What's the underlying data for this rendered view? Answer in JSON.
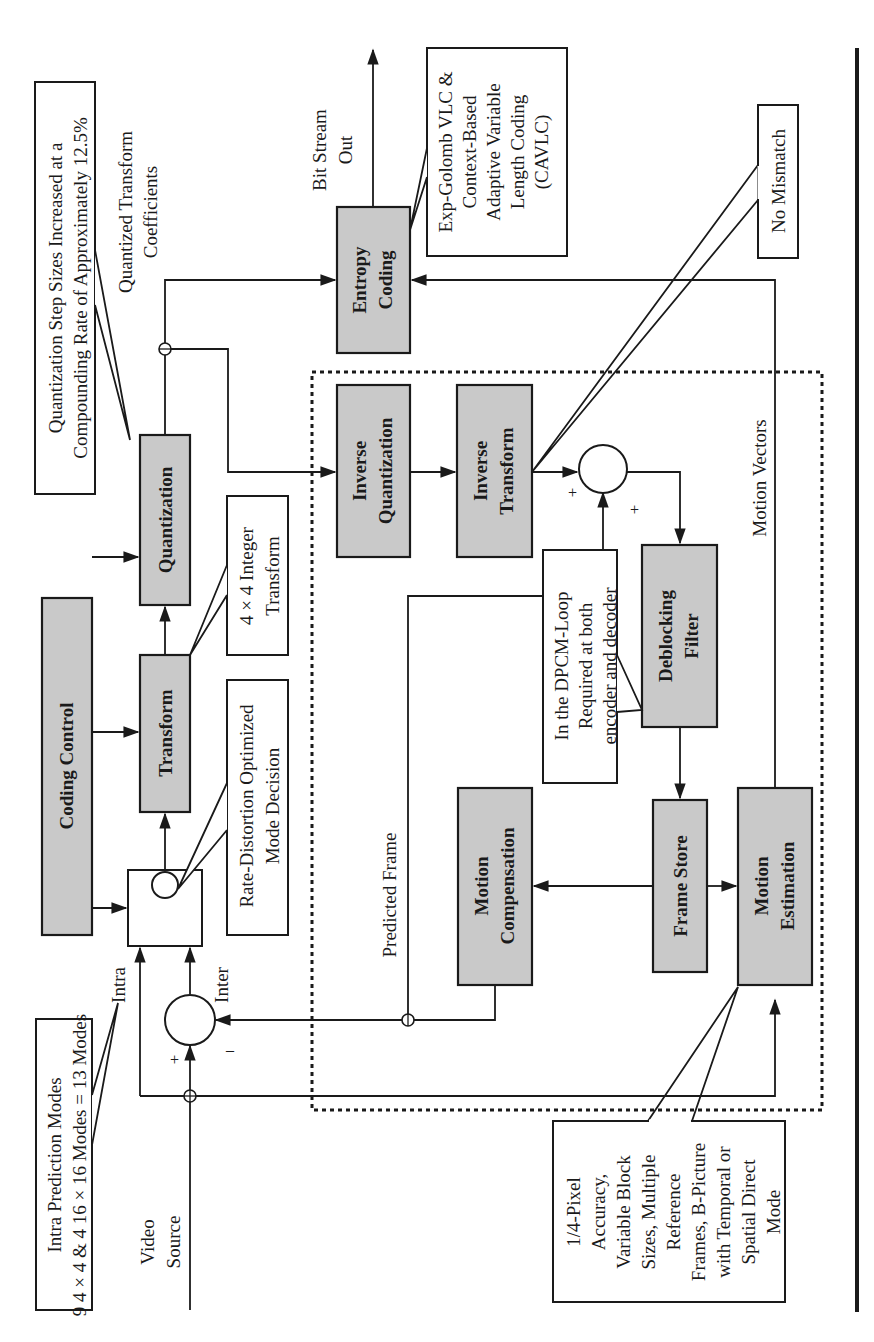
{
  "figure": {
    "orientation": "rotated-90-ccw",
    "colors": {
      "block_fill": "#c9c9c9",
      "stroke": "#1a1a1a",
      "background": "#ffffff"
    }
  },
  "inputs": {
    "video_source": [
      "Video",
      "Source"
    ]
  },
  "outputs": {
    "bit_stream": [
      "Bit Stream",
      "Out"
    ]
  },
  "blocks": {
    "coding_control": [
      "Coding Control"
    ],
    "transform": [
      "Transform"
    ],
    "quantization": [
      "Quantization"
    ],
    "entropy_coding": [
      "Entropy",
      "Coding"
    ],
    "inverse_quantization": [
      "Inverse",
      "Quantization"
    ],
    "inverse_transform": [
      "Inverse",
      "Transform"
    ],
    "deblocking_filter": [
      "Deblocking",
      "Filter"
    ],
    "motion_compensation": [
      "Motion",
      "Compensation"
    ],
    "frame_store": [
      "Frame Store"
    ],
    "motion_estimation": [
      "Motion",
      "Estimation"
    ]
  },
  "annotations": {
    "intra_modes": [
      "Intra Prediction Modes",
      "9 4 × 4 & 4 16 × 16 Modes = 13 Modes"
    ],
    "quant_step": [
      "Quantization Step Sizes Increased at a",
      "Compounding Rate of Approximately 12.5%"
    ],
    "rd_mode": [
      "Rate-Distortion Optimized",
      "Mode Decision"
    ],
    "integer_transform": [
      "4 × 4 Integer",
      "Transform"
    ],
    "entropy_detail": [
      "Exp-Golomb VLC &",
      "Context-Based",
      "Adaptive Variable",
      "Length Coding",
      "(CAVLC)"
    ],
    "no_mismatch": [
      "No Mismatch"
    ],
    "dpcm_loop": [
      "In the DPCM-Loop",
      "Required at both",
      "encoder and decoder"
    ],
    "motion_detail": [
      "1/4-Pixel",
      "Accuracy,",
      "Variable Block",
      "Sizes, Multiple",
      "Reference",
      "Frames, B-Picture",
      "with Temporal or",
      "Spatial Direct",
      "Mode"
    ]
  },
  "signal_labels": {
    "intra": "Intra",
    "inter": "Inter",
    "quantized_coeffs": [
      "Quantized Transform",
      "Coefficients"
    ],
    "predicted_frame": "Predicted Frame",
    "motion_vectors": "Motion Vectors",
    "plus": "+",
    "minus": "–"
  }
}
